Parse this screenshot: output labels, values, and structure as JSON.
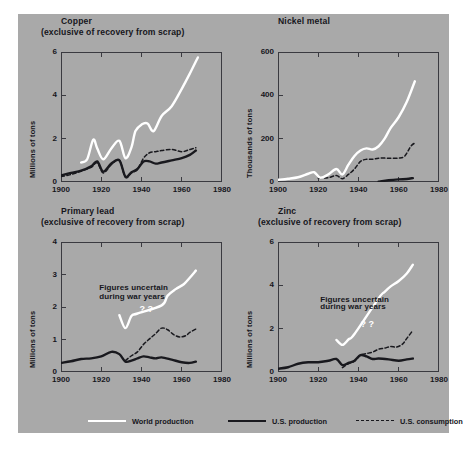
{
  "figure": {
    "background_color": "#a9a9a9",
    "legend": {
      "items": [
        {
          "label": "World production",
          "style": "solid-white",
          "color": "#ffffff"
        },
        {
          "label": "U.S. production",
          "style": "solid-black",
          "color": "#19191e"
        },
        {
          "label": "U.S. consumption",
          "style": "dashed-black",
          "color": "#19191e"
        }
      ]
    }
  },
  "chart_data": [
    {
      "type": "line",
      "id": "copper",
      "title": "Copper",
      "subtitle": "(exclusive of recovery from scrap)",
      "xlabel": "",
      "ylabel": "Millions of tons",
      "xlim": [
        1900,
        1980
      ],
      "ylim": [
        0,
        6
      ],
      "xticks": [
        1900,
        1920,
        1940,
        1960,
        1980
      ],
      "yticks": [
        0,
        2,
        4,
        6
      ],
      "grid": false,
      "annotations": [],
      "series": [
        {
          "name": "World production",
          "style": "solid-white",
          "color": "#ffffff",
          "x": [
            1910,
            1913,
            1916,
            1918,
            1921,
            1925,
            1929,
            1932,
            1935,
            1937,
            1940,
            1943,
            1946,
            1950,
            1955,
            1960,
            1964,
            1968
          ],
          "values": [
            0.9,
            1.05,
            1.95,
            1.55,
            1.05,
            1.55,
            1.9,
            1.1,
            1.6,
            2.35,
            2.65,
            2.7,
            2.35,
            3.05,
            3.5,
            4.3,
            5.0,
            5.75
          ]
        },
        {
          "name": "U.S. production",
          "style": "solid-black",
          "color": "#19191e",
          "x": [
            1900,
            1905,
            1910,
            1915,
            1918,
            1921,
            1925,
            1929,
            1932,
            1935,
            1938,
            1941,
            1944,
            1947,
            1950,
            1955,
            1960,
            1964,
            1967
          ],
          "values": [
            0.3,
            0.42,
            0.52,
            0.72,
            0.95,
            0.48,
            0.85,
            1.0,
            0.25,
            0.45,
            0.6,
            0.95,
            0.95,
            0.85,
            0.9,
            1.0,
            1.1,
            1.25,
            1.45
          ]
        },
        {
          "name": "U.S. consumption",
          "style": "dashed-black",
          "color": "#19191e",
          "x": [
            1900,
            1905,
            1910,
            1915,
            1918,
            1921,
            1925,
            1929,
            1932,
            1935,
            1938,
            1941,
            1944,
            1947,
            1950,
            1955,
            1960,
            1964,
            1967
          ],
          "values": [
            0.25,
            0.35,
            0.5,
            0.68,
            0.88,
            0.42,
            0.8,
            1.0,
            0.22,
            0.42,
            0.58,
            1.1,
            1.35,
            1.4,
            1.45,
            1.5,
            1.4,
            1.5,
            1.58
          ]
        }
      ]
    },
    {
      "type": "line",
      "id": "nickel",
      "title": "Nickel metal",
      "subtitle": "",
      "xlabel": "",
      "ylabel": "Thousands of tons",
      "xlim": [
        1900,
        1980
      ],
      "ylim": [
        0,
        600
      ],
      "xticks": [
        1900,
        1920,
        1940,
        1960,
        1980
      ],
      "yticks": [
        0,
        200,
        400,
        600
      ],
      "grid": false,
      "annotations": [],
      "series": [
        {
          "name": "World production",
          "style": "solid-white",
          "color": "#ffffff",
          "x": [
            1900,
            1905,
            1910,
            1915,
            1918,
            1921,
            1925,
            1929,
            1932,
            1935,
            1938,
            1941,
            1944,
            1947,
            1950,
            1953,
            1956,
            1960,
            1964,
            1968
          ],
          "values": [
            10,
            15,
            22,
            38,
            45,
            20,
            35,
            60,
            35,
            80,
            120,
            145,
            155,
            150,
            165,
            200,
            250,
            300,
            370,
            465
          ]
        },
        {
          "name": "U.S. production",
          "style": "solid-black",
          "color": "#19191e",
          "x": [
            1950,
            1955,
            1960,
            1964,
            1967
          ],
          "values": [
            2,
            8,
            12,
            14,
            18
          ]
        },
        {
          "name": "U.S. consumption",
          "style": "dashed-black",
          "color": "#19191e",
          "x": [
            1920,
            1925,
            1929,
            1932,
            1935,
            1938,
            1941,
            1944,
            1947,
            1950,
            1955,
            1960,
            1963,
            1966,
            1968
          ],
          "values": [
            18,
            20,
            30,
            15,
            35,
            60,
            95,
            105,
            105,
            110,
            110,
            110,
            120,
            165,
            180
          ]
        }
      ]
    },
    {
      "type": "line",
      "id": "primary-lead",
      "title": "Primary lead",
      "subtitle": "(exclusive of recovery from scrap)",
      "xlabel": "",
      "ylabel": "Millions of tons",
      "xlim": [
        1900,
        1980
      ],
      "ylim": [
        0,
        4
      ],
      "xticks": [
        1900,
        1920,
        1940,
        1960,
        1980
      ],
      "yticks": [
        0,
        1,
        2,
        3,
        4
      ],
      "grid": false,
      "annotations": [
        {
          "text": "Figures uncertain",
          "x": 1919,
          "y": 2.55
        },
        {
          "text": "during war years",
          "x": 1919,
          "y": 2.28
        },
        {
          "text": "? ?",
          "x": 1939,
          "y": 1.92
        }
      ],
      "series": [
        {
          "name": "World production",
          "style": "solid-white",
          "color": "#ffffff",
          "x": [
            1929,
            1932,
            1935,
            1938,
            1950,
            1953,
            1957,
            1961,
            1964,
            1967
          ],
          "values": [
            1.75,
            1.35,
            1.72,
            1.8,
            2.05,
            2.35,
            2.55,
            2.7,
            2.9,
            3.12
          ]
        },
        {
          "name": "U.S. production",
          "style": "solid-black",
          "color": "#19191e",
          "x": [
            1900,
            1905,
            1910,
            1915,
            1920,
            1925,
            1929,
            1932,
            1935,
            1938,
            1941,
            1944,
            1947,
            1950,
            1955,
            1960,
            1964,
            1967
          ],
          "values": [
            0.28,
            0.33,
            0.4,
            0.42,
            0.48,
            0.62,
            0.55,
            0.32,
            0.35,
            0.42,
            0.48,
            0.45,
            0.42,
            0.45,
            0.38,
            0.3,
            0.28,
            0.32
          ]
        },
        {
          "name": "U.S. consumption",
          "style": "dashed-black",
          "color": "#19191e",
          "x": [
            1932,
            1935,
            1938,
            1941,
            1944,
            1947,
            1950,
            1953,
            1956,
            1959,
            1962,
            1964,
            1967
          ],
          "values": [
            0.35,
            0.5,
            0.62,
            0.85,
            1.02,
            1.18,
            1.35,
            1.3,
            1.15,
            1.08,
            1.12,
            1.22,
            1.32
          ]
        }
      ]
    },
    {
      "type": "line",
      "id": "zinc",
      "title": "Zinc",
      "subtitle": "(exclusive of recovery from scrap)",
      "xlabel": "",
      "ylabel": "Millions of tons",
      "xlim": [
        1900,
        1980
      ],
      "ylim": [
        0,
        6
      ],
      "xticks": [
        1900,
        1920,
        1940,
        1960,
        1980
      ],
      "yticks": [
        0,
        2,
        4,
        6
      ],
      "grid": false,
      "annotations": [
        {
          "text": "Figures uncertain",
          "x": 1921,
          "y": 3.3
        },
        {
          "text": "during war years",
          "x": 1921,
          "y": 2.95
        },
        {
          "text": "? ?",
          "x": 1941,
          "y": 2.18
        }
      ],
      "series": [
        {
          "name": "World production",
          "style": "solid-white",
          "color": "#ffffff",
          "x": [
            1929,
            1932,
            1935,
            1938,
            1950,
            1953,
            1956,
            1960,
            1964,
            1967
          ],
          "values": [
            1.48,
            1.25,
            1.5,
            1.75,
            3.4,
            3.7,
            3.95,
            4.2,
            4.55,
            4.95
          ]
        },
        {
          "name": "U.S. production",
          "style": "solid-black",
          "color": "#19191e",
          "x": [
            1900,
            1905,
            1910,
            1915,
            1920,
            1925,
            1929,
            1932,
            1935,
            1938,
            1941,
            1944,
            1947,
            1950,
            1955,
            1960,
            1964,
            1967
          ],
          "values": [
            0.15,
            0.22,
            0.38,
            0.45,
            0.45,
            0.52,
            0.6,
            0.32,
            0.42,
            0.52,
            0.78,
            0.72,
            0.6,
            0.62,
            0.58,
            0.52,
            0.58,
            0.62
          ]
        },
        {
          "name": "U.S. consumption",
          "style": "dashed-black",
          "color": "#19191e",
          "x": [
            1932,
            1935,
            1938,
            1941,
            1944,
            1947,
            1950,
            1953,
            1956,
            1959,
            1962,
            1964,
            1967
          ],
          "values": [
            0.2,
            0.38,
            0.5,
            0.78,
            0.85,
            0.92,
            1.05,
            1.1,
            1.18,
            1.15,
            1.3,
            1.55,
            1.92
          ]
        }
      ]
    }
  ]
}
